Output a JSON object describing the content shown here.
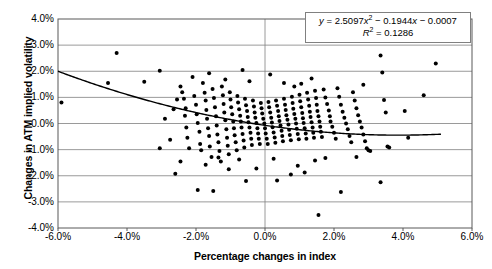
{
  "chart_data": {
    "type": "scatter",
    "title": "",
    "xlabel": "Percentage changes in index",
    "ylabel": "Changes in ATM implied volatility",
    "xlim": [
      -6.0,
      6.0
    ],
    "ylim": [
      -4.0,
      4.0
    ],
    "xticks": [
      "-6.0%",
      "-4.0%",
      "-2.0%",
      "0.0%",
      "2.0%",
      "4.0%",
      "6.0%"
    ],
    "xtick_values": [
      -6.0,
      -4.0,
      -2.0,
      0.0,
      2.0,
      4.0,
      6.0
    ],
    "yticks": [
      "4.0%",
      "3.0%",
      "2.0%",
      "1.0%",
      "0.0%",
      "-1.0%",
      "-2.0%",
      "-3.0%",
      "-4.0%"
    ],
    "ytick_values": [
      4.0,
      3.0,
      2.0,
      1.0,
      0.0,
      -1.0,
      -2.0,
      -3.0,
      -4.0
    ],
    "grid": "horizontal",
    "legend": "none",
    "annotation": {
      "equation": "y = 2.5097x² − 0.1944x − 0.0007",
      "r_squared": "R² = 0.1286",
      "equation_coefficients": {
        "a": 2.5097,
        "b": -0.1944,
        "c": -0.0007
      },
      "r_squared_value": 0.1286
    },
    "trendline": {
      "type": "polynomial",
      "order": 2,
      "x_start": -6.0,
      "x_end": 5.1,
      "color": "#000000"
    },
    "marker": {
      "shape": "circle",
      "color": "#000000",
      "size": 2.0
    },
    "series": [
      {
        "name": "Index vs ATM implied volatility",
        "points": [
          [
            -5.9,
            0.8
          ],
          [
            -4.3,
            2.7
          ],
          [
            -4.55,
            1.55
          ],
          [
            -3.5,
            1.6
          ],
          [
            -3.05,
            2.02
          ],
          [
            -2.45,
            1.42
          ],
          [
            -2.4,
            1.2
          ],
          [
            -2.35,
            0.95
          ],
          [
            -2.3,
            0.58
          ],
          [
            -2.32,
            0.3
          ],
          [
            -2.28,
            -0.15
          ],
          [
            -2.25,
            -0.55
          ],
          [
            -2.2,
            -0.95
          ],
          [
            -2.1,
            1.78
          ],
          [
            -2.05,
            1.05
          ],
          [
            -2.0,
            0.72
          ],
          [
            -1.98,
            0.35
          ],
          [
            -1.95,
            0.02
          ],
          [
            -1.9,
            -0.32
          ],
          [
            -1.88,
            -0.78
          ],
          [
            -1.85,
            -1.02
          ],
          [
            -1.8,
            1.55
          ],
          [
            -1.75,
            1.18
          ],
          [
            -1.72,
            0.88
          ],
          [
            -1.7,
            0.52
          ],
          [
            -1.68,
            0.18
          ],
          [
            -1.65,
            -0.18
          ],
          [
            -1.62,
            -0.48
          ],
          [
            -1.6,
            -0.88
          ],
          [
            -1.55,
            -1.28
          ],
          [
            -1.52,
            1.32
          ],
          [
            -1.48,
            0.98
          ],
          [
            -1.45,
            0.62
          ],
          [
            -1.42,
            0.28
          ],
          [
            -1.4,
            -0.08
          ],
          [
            -1.38,
            -0.42
          ],
          [
            -1.35,
            -0.72
          ],
          [
            -1.32,
            -1.05
          ],
          [
            -1.28,
            -1.45
          ],
          [
            -1.25,
            1.42
          ],
          [
            -1.22,
            1.08
          ],
          [
            -1.2,
            0.75
          ],
          [
            -1.18,
            0.42
          ],
          [
            -1.15,
            0.12
          ],
          [
            -1.12,
            -0.22
          ],
          [
            -1.1,
            -0.55
          ],
          [
            -1.08,
            -0.85
          ],
          [
            -1.05,
            -1.18
          ],
          [
            -1.02,
            1.2
          ],
          [
            -1.0,
            0.92
          ],
          [
            -0.98,
            0.62
          ],
          [
            -0.95,
            0.35
          ],
          [
            -0.92,
            0.08
          ],
          [
            -0.9,
            -0.18
          ],
          [
            -0.88,
            -0.45
          ],
          [
            -0.85,
            -0.72
          ],
          [
            -0.82,
            -1.02
          ],
          [
            -0.8,
            1.05
          ],
          [
            -0.78,
            0.8
          ],
          [
            -0.75,
            0.55
          ],
          [
            -0.72,
            0.3
          ],
          [
            -0.7,
            0.08
          ],
          [
            -0.68,
            -0.15
          ],
          [
            -0.65,
            -0.4
          ],
          [
            -0.62,
            -0.65
          ],
          [
            -0.6,
            -0.92
          ],
          [
            -0.58,
            0.95
          ],
          [
            -0.55,
            0.7
          ],
          [
            -0.52,
            0.48
          ],
          [
            -0.5,
            0.25
          ],
          [
            -0.48,
            0.05
          ],
          [
            -0.45,
            -0.15
          ],
          [
            -0.42,
            -0.35
          ],
          [
            -0.4,
            -0.58
          ],
          [
            -0.38,
            -0.82
          ],
          [
            -0.35,
            0.88
          ],
          [
            -0.32,
            0.65
          ],
          [
            -0.3,
            0.42
          ],
          [
            -0.28,
            0.22
          ],
          [
            -0.25,
            0.02
          ],
          [
            -0.22,
            -0.18
          ],
          [
            -0.2,
            -0.38
          ],
          [
            -0.18,
            -0.58
          ],
          [
            -0.15,
            -0.78
          ],
          [
            -0.12,
            0.78
          ],
          [
            -0.1,
            0.58
          ],
          [
            -0.08,
            0.38
          ],
          [
            -0.05,
            0.18
          ],
          [
            -0.02,
            0.0
          ],
          [
            0.0,
            -0.18
          ],
          [
            0.02,
            -0.38
          ],
          [
            0.05,
            -0.58
          ],
          [
            0.08,
            -0.78
          ],
          [
            0.1,
            0.82
          ],
          [
            0.12,
            0.62
          ],
          [
            0.15,
            0.42
          ],
          [
            0.18,
            0.22
          ],
          [
            0.2,
            0.04
          ],
          [
            0.22,
            -0.14
          ],
          [
            0.25,
            -0.34
          ],
          [
            0.28,
            -0.54
          ],
          [
            0.3,
            -0.74
          ],
          [
            0.32,
            0.88
          ],
          [
            0.35,
            0.68
          ],
          [
            0.38,
            0.48
          ],
          [
            0.4,
            0.28
          ],
          [
            0.42,
            0.1
          ],
          [
            0.45,
            -0.08
          ],
          [
            0.48,
            -0.28
          ],
          [
            0.5,
            -0.48
          ],
          [
            0.52,
            -0.68
          ],
          [
            0.55,
            0.95
          ],
          [
            0.58,
            0.72
          ],
          [
            0.6,
            0.52
          ],
          [
            0.62,
            0.32
          ],
          [
            0.65,
            0.14
          ],
          [
            0.68,
            -0.04
          ],
          [
            0.7,
            -0.24
          ],
          [
            0.72,
            -0.44
          ],
          [
            0.75,
            -0.64
          ],
          [
            0.78,
            1.02
          ],
          [
            0.8,
            0.78
          ],
          [
            0.82,
            0.56
          ],
          [
            0.85,
            0.36
          ],
          [
            0.88,
            0.18
          ],
          [
            0.9,
            0.0
          ],
          [
            0.92,
            -0.2
          ],
          [
            0.95,
            -0.4
          ],
          [
            0.98,
            -0.6
          ],
          [
            1.0,
            1.1
          ],
          [
            1.02,
            0.85
          ],
          [
            1.05,
            0.62
          ],
          [
            1.08,
            0.4
          ],
          [
            1.1,
            0.2
          ],
          [
            1.12,
            0.02
          ],
          [
            1.15,
            -0.18
          ],
          [
            1.18,
            -0.38
          ],
          [
            1.2,
            -0.58
          ],
          [
            1.22,
            1.18
          ],
          [
            1.25,
            0.92
          ],
          [
            1.28,
            0.68
          ],
          [
            1.3,
            0.45
          ],
          [
            1.32,
            0.25
          ],
          [
            1.35,
            0.05
          ],
          [
            1.38,
            -0.15
          ],
          [
            1.4,
            -0.35
          ],
          [
            1.42,
            -0.55
          ],
          [
            1.45,
            1.25
          ],
          [
            1.48,
            0.98
          ],
          [
            1.5,
            0.72
          ],
          [
            1.52,
            0.48
          ],
          [
            1.55,
            0.28
          ],
          [
            1.58,
            0.08
          ],
          [
            1.6,
            -0.12
          ],
          [
            1.62,
            -0.32
          ],
          [
            1.65,
            -0.52
          ],
          [
            1.7,
            1.3
          ],
          [
            1.75,
            1.0
          ],
          [
            1.8,
            0.75
          ],
          [
            1.85,
            0.5
          ],
          [
            1.88,
            0.28
          ],
          [
            1.9,
            0.08
          ],
          [
            1.95,
            -0.12
          ],
          [
            2.0,
            -0.35
          ],
          [
            2.05,
            -0.58
          ],
          [
            2.1,
            1.35
          ],
          [
            2.15,
            1.02
          ],
          [
            2.2,
            0.72
          ],
          [
            2.25,
            0.45
          ],
          [
            2.3,
            0.22
          ],
          [
            2.35,
            0.0
          ],
          [
            2.4,
            -0.22
          ],
          [
            2.45,
            -0.48
          ],
          [
            2.5,
            -0.72
          ],
          [
            2.55,
            1.2
          ],
          [
            2.6,
            0.88
          ],
          [
            2.65,
            0.58
          ],
          [
            2.7,
            0.32
          ],
          [
            2.75,
            0.08
          ],
          [
            2.8,
            -0.15
          ],
          [
            2.85,
            -0.42
          ],
          [
            2.9,
            -0.68
          ],
          [
            2.95,
            -0.95
          ],
          [
            3.0,
            -1.02
          ],
          [
            3.05,
            -1.05
          ],
          [
            2.2,
            -2.62
          ],
          [
            3.35,
            2.6
          ],
          [
            3.4,
            1.95
          ],
          [
            3.45,
            0.9
          ],
          [
            3.5,
            0.42
          ],
          [
            3.55,
            -0.88
          ],
          [
            3.6,
            -0.92
          ],
          [
            3.35,
            -2.25
          ],
          [
            4.05,
            0.48
          ],
          [
            4.6,
            1.08
          ],
          [
            4.15,
            -0.55
          ],
          [
            4.95,
            2.3
          ],
          [
            1.55,
            -3.5
          ],
          [
            -1.95,
            -2.55
          ],
          [
            -1.5,
            -2.58
          ],
          [
            -0.55,
            -2.2
          ],
          [
            0.35,
            -2.18
          ],
          [
            -2.6,
            -1.92
          ],
          [
            0.75,
            -1.95
          ],
          [
            1.15,
            -1.88
          ],
          [
            -1.05,
            -1.75
          ],
          [
            -0.25,
            -1.72
          ],
          [
            0.95,
            -1.62
          ],
          [
            -1.72,
            -1.58
          ],
          [
            -2.45,
            -1.45
          ],
          [
            1.45,
            -1.42
          ],
          [
            -0.75,
            -1.38
          ],
          [
            0.25,
            -1.35
          ],
          [
            1.75,
            -1.32
          ],
          [
            -1.35,
            -1.3
          ],
          [
            2.65,
            -1.28
          ],
          [
            -3.05,
            -0.95
          ],
          [
            -2.75,
            -0.62
          ],
          [
            -2.9,
            0.18
          ],
          [
            -2.65,
            0.55
          ],
          [
            -2.55,
            0.92
          ],
          [
            2.85,
            1.48
          ],
          [
            -0.45,
            1.62
          ],
          [
            0.55,
            1.55
          ],
          [
            1.05,
            1.52
          ],
          [
            -1.15,
            1.68
          ],
          [
            0.15,
            1.88
          ],
          [
            1.35,
            1.72
          ],
          [
            -0.65,
            2.05
          ],
          [
            0.85,
            1.42
          ],
          [
            -1.62,
            1.92
          ]
        ]
      }
    ]
  },
  "annotation_text": {
    "eq_prefix": "y",
    "eq_body": " = 2.5097",
    "eq_x1": "x",
    "eq_sup1": "2",
    "eq_mid": " − 0.1944",
    "eq_x2": "x",
    "eq_tail": " − 0.0007",
    "r_label": "R",
    "r_sup": "2",
    "r_value": " = 0.1286"
  }
}
